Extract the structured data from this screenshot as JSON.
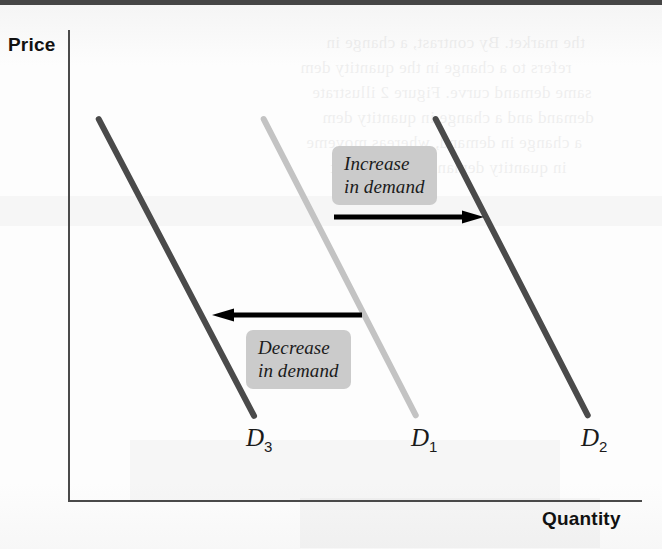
{
  "figure": {
    "type": "economics-demand-shift-diagram",
    "axes": {
      "y_label": "Price",
      "x_label": "Quantity"
    },
    "curves": [
      {
        "id": "d3",
        "label": "D",
        "subscript": "3",
        "color": "#4a4a4a",
        "role": "decreased-demand",
        "position": "left",
        "x1": 100,
        "y1": 118,
        "x2": 258,
        "y2": 420
      },
      {
        "id": "d1",
        "label": "D",
        "subscript": "1",
        "color": "#c3c3c3",
        "role": "original-demand",
        "position": "center",
        "x1": 265,
        "y1": 118,
        "x2": 420,
        "y2": 420
      },
      {
        "id": "d2",
        "label": "D",
        "subscript": "2",
        "color": "#4a4a4a",
        "role": "increased-demand",
        "position": "right",
        "x1": 437,
        "y1": 118,
        "x2": 592,
        "y2": 420
      }
    ],
    "annotations": [
      {
        "id": "increase",
        "text": "Increase\nin demand",
        "box_color": "#cbcbcb",
        "arrow_direction": "right",
        "arrow_color": "#000000"
      },
      {
        "id": "decrease",
        "text": "Decrease\nin demand",
        "box_color": "#cbcbcb",
        "arrow_direction": "left",
        "arrow_color": "#000000"
      }
    ],
    "background_artifacts": {
      "description": "faint mirrored bleed-through text from reverse side of scanned page",
      "lines": [
        "the market. By contrast, a change in",
        "refers to a change in the quantity dem",
        "same demand curve. Figure 2 illustrate",
        "demand and a change in quantity dem",
        "a change in demand, whereas moveme",
        "in quantity demanded only result"
      ]
    }
  }
}
